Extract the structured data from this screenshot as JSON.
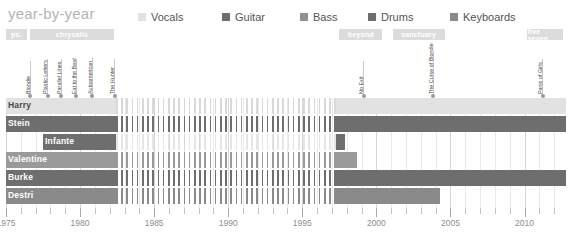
{
  "title": "year-by-year",
  "legend": {
    "items": [
      {
        "label": "Vocals",
        "color": "#e2e2e2",
        "x": 138
      },
      {
        "label": "Guitar",
        "color": "#6e6e6e",
        "x": 222
      },
      {
        "label": "Bass",
        "color": "#909090",
        "x": 300
      },
      {
        "label": "Drums",
        "color": "#6e6e6e",
        "x": 368
      },
      {
        "label": "Keyboards",
        "color": "#8a8a8a",
        "x": 450
      }
    ]
  },
  "record_labels": [
    {
      "name": "ps.",
      "start": 1975.0,
      "end": 1976.4
    },
    {
      "name": "chrysalis",
      "start": 1976.6,
      "end": 1982.3
    },
    {
      "name": "beyond",
      "start": 1997.5,
      "end": 2000.4
    },
    {
      "name": "sanctuary",
      "start": 2001.1,
      "end": 2004.6
    },
    {
      "name": "five seven",
      "start": 2010.2,
      "end": 2012.6
    }
  ],
  "albums": [
    {
      "title": "Blondie",
      "year": 1976.6,
      "stem": 34
    },
    {
      "title": "Plastic Letters",
      "year": 1977.8,
      "stem": 36
    },
    {
      "title": "Parallel Lines",
      "year": 1978.7,
      "stem": 36
    },
    {
      "title": "Eat to the Beat",
      "year": 1979.7,
      "stem": 36
    },
    {
      "title": "Autoamerican",
      "year": 1980.8,
      "stem": 38
    },
    {
      "title": "The Hunter",
      "year": 1982.3,
      "stem": 36
    },
    {
      "title": "No Exit",
      "year": 1999.1,
      "stem": 34
    },
    {
      "title": "The Curse of Blondie",
      "year": 2003.8,
      "stem": 44
    },
    {
      "title": "Panic of Girls",
      "year": 2011.2,
      "stem": 36
    }
  ],
  "chart_data": {
    "type": "bar",
    "title": "year-by-year",
    "xlabel": "",
    "ylabel": "",
    "xlim": [
      1975,
      2012.8
    ],
    "grid": true,
    "legend_position": "top",
    "tick_labels": [
      "1975",
      "1980",
      "1985",
      "1990",
      "1995",
      "2000",
      "2005",
      "2010"
    ],
    "tick_values": [
      1975,
      1980,
      1985,
      1990,
      1995,
      2000,
      2005,
      2010
    ],
    "minor_tick_step": 1,
    "categories": [
      "Harry",
      "Stein",
      "Infante",
      "Valentine",
      "Burke",
      "Destri"
    ],
    "series": [
      {
        "name": "Harry",
        "role": "Vocals",
        "color": "#e2e2e2",
        "segments": [
          {
            "start": 1975.0,
            "end": 1982.4,
            "style": "solid"
          },
          {
            "start": 1982.4,
            "end": 1997.3,
            "style": "hatch"
          },
          {
            "start": 1997.3,
            "end": 2012.8,
            "style": "solid"
          }
        ]
      },
      {
        "name": "Stein",
        "role": "Guitar",
        "color": "#6e6e6e",
        "segments": [
          {
            "start": 1975.0,
            "end": 1982.4,
            "style": "solid"
          },
          {
            "start": 1982.4,
            "end": 1997.3,
            "style": "hatch"
          },
          {
            "start": 1997.3,
            "end": 2012.8,
            "style": "solid"
          }
        ]
      },
      {
        "name": "Infante",
        "role": "Bass",
        "color": "#6e6e6e",
        "segments": [
          {
            "start": 1977.5,
            "end": 1982.4,
            "style": "solid"
          },
          {
            "start": 1982.4,
            "end": 1997.3,
            "style": "hatch-faint"
          },
          {
            "start": 1997.3,
            "end": 1997.9,
            "style": "solid"
          }
        ]
      },
      {
        "name": "Valentine",
        "role": "Drums",
        "color": "#9a9a9a",
        "segments": [
          {
            "start": 1975.0,
            "end": 1982.4,
            "style": "solid"
          },
          {
            "start": 1982.4,
            "end": 1997.3,
            "style": "hatch"
          },
          {
            "start": 1997.3,
            "end": 1998.7,
            "style": "solid"
          }
        ]
      },
      {
        "name": "Burke",
        "role": "Drums",
        "color": "#6e6e6e",
        "segments": [
          {
            "start": 1975.0,
            "end": 1982.4,
            "style": "solid"
          },
          {
            "start": 1982.4,
            "end": 1997.3,
            "style": "hatch"
          },
          {
            "start": 1997.3,
            "end": 2012.8,
            "style": "solid"
          }
        ]
      },
      {
        "name": "Destri",
        "role": "Keyboards",
        "color": "#8a8a8a",
        "segments": [
          {
            "start": 1975.0,
            "end": 1982.4,
            "style": "solid"
          },
          {
            "start": 1982.4,
            "end": 1997.3,
            "style": "hatch"
          },
          {
            "start": 1997.3,
            "end": 2004.3,
            "style": "solid"
          }
        ]
      }
    ]
  }
}
